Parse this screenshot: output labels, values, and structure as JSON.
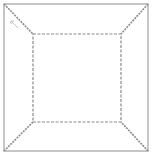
{
  "diagram": {
    "title": "",
    "type": "perspective-box-wireframe",
    "colors": {
      "background": "#ffffff",
      "outer_frame": "#a0a0a0",
      "inner_square": "#8a8a8a",
      "diagonals": "#8a8a8a",
      "arrow": "#c0c0c0"
    },
    "outer_frame": {
      "x1": 4,
      "y1": 4,
      "x2": 148,
      "y2": 151,
      "style": "solid"
    },
    "inner_square": {
      "x1": 33,
      "y1": 34,
      "x2": 121,
      "y2": 122,
      "style": "dashed"
    },
    "diagonals": [
      {
        "name": "top-left",
        "from": [
          4,
          4
        ],
        "to": [
          33,
          34
        ]
      },
      {
        "name": "top-right",
        "from": [
          148,
          4
        ],
        "to": [
          121,
          34
        ]
      },
      {
        "name": "bottom-left",
        "from": [
          4,
          151
        ],
        "to": [
          33,
          122
        ]
      },
      {
        "name": "bottom-right",
        "from": [
          148,
          151
        ],
        "to": [
          121,
          122
        ]
      }
    ],
    "arrow": {
      "from": [
        18,
        28
      ],
      "to": [
        11,
        21
      ],
      "direction": "toward-top-left"
    }
  }
}
